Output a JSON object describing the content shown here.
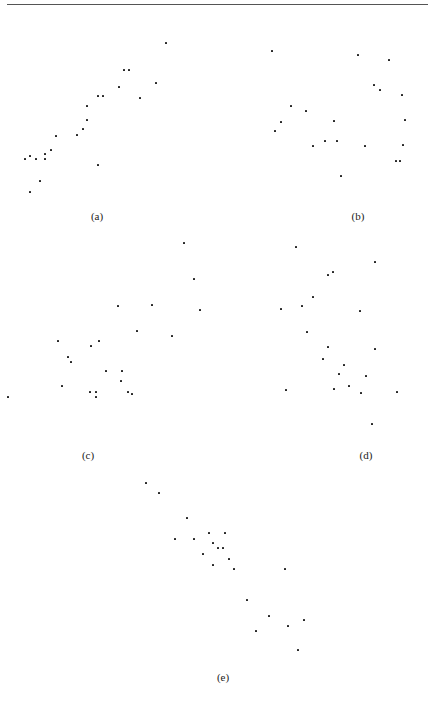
{
  "page": {
    "rule": true
  },
  "chart_data": [
    {
      "type": "scatter",
      "label": "(a)",
      "label_pos": [
        97,
        210
      ],
      "points": [
        [
          166,
          43
        ],
        [
          124,
          70
        ],
        [
          129,
          70
        ],
        [
          119,
          87
        ],
        [
          156,
          83
        ],
        [
          98,
          96
        ],
        [
          103,
          96
        ],
        [
          140,
          98
        ],
        [
          87,
          106
        ],
        [
          87,
          120
        ],
        [
          83,
          129
        ],
        [
          77,
          135
        ],
        [
          56,
          136
        ],
        [
          51,
          150
        ],
        [
          45,
          154
        ],
        [
          25,
          159
        ],
        [
          30,
          156
        ],
        [
          36,
          159
        ],
        [
          45,
          159
        ],
        [
          98,
          165
        ],
        [
          40,
          181
        ],
        [
          30,
          192
        ]
      ]
    },
    {
      "type": "scatter",
      "label": "(b)",
      "label_pos": [
        358,
        210
      ],
      "points": [
        [
          272,
          51
        ],
        [
          358,
          55
        ],
        [
          389,
          60
        ],
        [
          374,
          85
        ],
        [
          380,
          90
        ],
        [
          402,
          95
        ],
        [
          291,
          106
        ],
        [
          306,
          111
        ],
        [
          281,
          122
        ],
        [
          334,
          121
        ],
        [
          405,
          120
        ],
        [
          275,
          131
        ],
        [
          313,
          146
        ],
        [
          325,
          141
        ],
        [
          337,
          141
        ],
        [
          365,
          146
        ],
        [
          403,
          145
        ],
        [
          396,
          161
        ],
        [
          400,
          161
        ],
        [
          341,
          176
        ]
      ]
    },
    {
      "type": "scatter",
      "label": "(c)",
      "label_pos": [
        88,
        449
      ],
      "points": [
        [
          184,
          243
        ],
        [
          194,
          279
        ],
        [
          200,
          310
        ],
        [
          118,
          306
        ],
        [
          152,
          305
        ],
        [
          137,
          331
        ],
        [
          172,
          336
        ],
        [
          58,
          341
        ],
        [
          99,
          341
        ],
        [
          91,
          346
        ],
        [
          68,
          357
        ],
        [
          71,
          362
        ],
        [
          106,
          371
        ],
        [
          122,
          371
        ],
        [
          121,
          381
        ],
        [
          62,
          386
        ],
        [
          90,
          392
        ],
        [
          96,
          392
        ],
        [
          96,
          397
        ],
        [
          128,
          392
        ],
        [
          132,
          394
        ],
        [
          8,
          397
        ]
      ]
    },
    {
      "type": "scatter",
      "label": "(d)",
      "label_pos": [
        366,
        449
      ],
      "points": [
        [
          296,
          247
        ],
        [
          375,
          262
        ],
        [
          333,
          272
        ],
        [
          328,
          275
        ],
        [
          313,
          297
        ],
        [
          302,
          306
        ],
        [
          281,
          309
        ],
        [
          360,
          311
        ],
        [
          307,
          332
        ],
        [
          328,
          347
        ],
        [
          375,
          349
        ],
        [
          323,
          359
        ],
        [
          344,
          365
        ],
        [
          339,
          374
        ],
        [
          366,
          376
        ],
        [
          349,
          386
        ],
        [
          286,
          390
        ],
        [
          334,
          389
        ],
        [
          361,
          393
        ],
        [
          397,
          392
        ],
        [
          372,
          424
        ]
      ]
    },
    {
      "type": "scatter",
      "label": "(e)",
      "label_pos": [
        223,
        671
      ],
      "points": [
        [
          146,
          483
        ],
        [
          159,
          493
        ],
        [
          187,
          518
        ],
        [
          209,
          533
        ],
        [
          225,
          533
        ],
        [
          175,
          539
        ],
        [
          194,
          539
        ],
        [
          213,
          543
        ],
        [
          218,
          548
        ],
        [
          223,
          548
        ],
        [
          203,
          554
        ],
        [
          229,
          559
        ],
        [
          213,
          565
        ],
        [
          234,
          569
        ],
        [
          285,
          569
        ],
        [
          247,
          600
        ],
        [
          269,
          616
        ],
        [
          304,
          620
        ],
        [
          288,
          626
        ],
        [
          256,
          631
        ],
        [
          298,
          650
        ]
      ]
    }
  ]
}
